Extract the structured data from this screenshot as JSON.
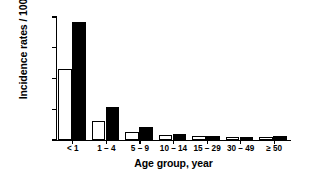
{
  "chart_data": {
    "type": "bar",
    "title": "",
    "subtitle": "",
    "xlabel": "Age group, year",
    "ylabel": "Incidence rates / 100,000",
    "categories": [
      "< 1",
      "1 – 4",
      "5 – 9",
      "10 – 14",
      "15 – 29",
      "30 – 49",
      "≥ 50"
    ],
    "series": [
      {
        "name": "open",
        "style": "open-white-bar",
        "values": [
          2300,
          630,
          250,
          150,
          120,
          110,
          100
        ]
      },
      {
        "name": "solid",
        "style": "solid-black-bar",
        "values": [
          3850,
          1080,
          410,
          180,
          120,
          110,
          140
        ]
      }
    ],
    "ylim": [
      0,
      4000
    ],
    "ytick_values": [
      0,
      1000,
      2000,
      3000,
      4000
    ],
    "ytick_labels": [
      "0",
      "1,000",
      "2,000",
      "3,000",
      "4,000"
    ],
    "grid": false,
    "legend": "none",
    "legend_position": "none",
    "annotations": []
  },
  "colors": {
    "axis": "#000000",
    "open_bar_fill": "#ffffff",
    "open_bar_edge": "#000000",
    "solid_bar_fill": "#000000",
    "background": "#ffffff",
    "text": "#000000"
  }
}
